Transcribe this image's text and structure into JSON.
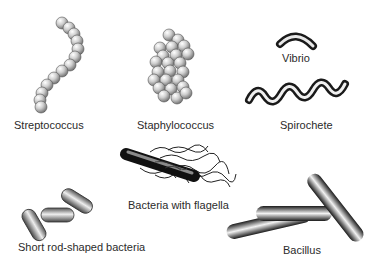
{
  "diagram": {
    "labels": {
      "streptococcus": "Streptococcus",
      "staphylococcus": "Staphylococcus",
      "vibrio": "Vibrio",
      "spirochete": "Spirochete",
      "flagella": "Bacteria with flagella",
      "short_rod": "Short rod-shaped bacteria",
      "bacillus": "Bacillus"
    }
  }
}
